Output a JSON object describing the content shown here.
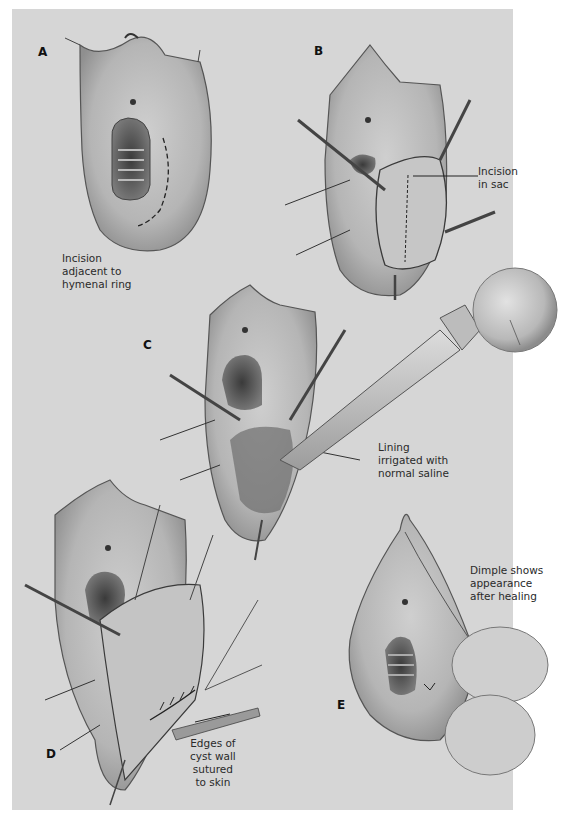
{
  "figure": {
    "background_color": "#d7d7d7",
    "ink_color": "#2a2a2a",
    "panels": [
      {
        "id": "A",
        "label": "A",
        "caption": "Incision\nadjacent to\nhymenal ring"
      },
      {
        "id": "B",
        "label": "B",
        "caption": "Incision\nin sac"
      },
      {
        "id": "C",
        "label": "C",
        "caption": "Lining\nirrigated with\nnormal saline"
      },
      {
        "id": "D",
        "label": "D",
        "caption": "Edges of\ncyst wall\nsutured\nto skin"
      },
      {
        "id": "E",
        "label": "E",
        "caption": "Dimple shows\nappearance\nafter healing"
      }
    ]
  }
}
